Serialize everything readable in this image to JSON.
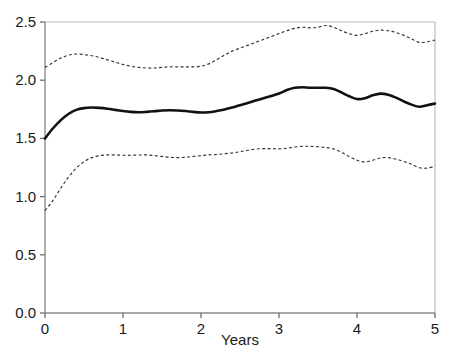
{
  "chart_data": {
    "type": "line",
    "title": "",
    "subtitle": "",
    "xlabel": "Years",
    "ylabel": "",
    "xlim": [
      0,
      5
    ],
    "ylim": [
      0,
      2.5
    ],
    "x_ticks": [
      "0",
      "1",
      "2",
      "3",
      "4",
      "5"
    ],
    "x_tick_values": [
      0,
      1,
      2,
      3,
      4,
      5
    ],
    "y_ticks": [
      "0.0",
      "0.5",
      "1.0",
      "1.5",
      "2.0",
      "2.5"
    ],
    "y_tick_values": [
      0.0,
      0.5,
      1.0,
      1.5,
      2.0,
      2.5
    ],
    "grid": false,
    "legend_position": "none",
    "x": [
      0.0,
      0.1,
      0.2,
      0.3,
      0.4,
      0.5,
      0.6,
      0.7,
      0.8,
      0.9,
      1.0,
      1.1,
      1.2,
      1.3,
      1.4,
      1.5,
      1.6,
      1.7,
      1.8,
      1.9,
      2.0,
      2.1,
      2.2,
      2.3,
      2.4,
      2.5,
      2.6,
      2.7,
      2.8,
      2.9,
      3.0,
      3.1,
      3.2,
      3.3,
      3.4,
      3.5,
      3.6,
      3.7,
      3.8,
      3.9,
      4.0,
      4.1,
      4.2,
      4.3,
      4.4,
      4.5,
      4.6,
      4.7,
      4.8,
      4.9,
      5.0
    ],
    "series": [
      {
        "name": "upper confidence limit",
        "style": "dashed",
        "color": "#333333",
        "values": [
          2.11,
          2.15,
          2.19,
          2.215,
          2.225,
          2.22,
          2.21,
          2.195,
          2.175,
          2.155,
          2.135,
          2.12,
          2.11,
          2.105,
          2.105,
          2.11,
          2.115,
          2.115,
          2.115,
          2.115,
          2.12,
          2.14,
          2.175,
          2.215,
          2.25,
          2.275,
          2.3,
          2.325,
          2.35,
          2.375,
          2.4,
          2.425,
          2.445,
          2.455,
          2.45,
          2.455,
          2.47,
          2.455,
          2.425,
          2.4,
          2.385,
          2.4,
          2.42,
          2.43,
          2.425,
          2.41,
          2.385,
          2.355,
          2.325,
          2.33,
          2.345
        ]
      },
      {
        "name": "mean estimate",
        "style": "solid",
        "color": "#111111",
        "values": [
          1.5,
          1.585,
          1.655,
          1.71,
          1.745,
          1.76,
          1.765,
          1.762,
          1.755,
          1.745,
          1.735,
          1.728,
          1.725,
          1.728,
          1.733,
          1.74,
          1.742,
          1.74,
          1.735,
          1.728,
          1.722,
          1.725,
          1.735,
          1.748,
          1.765,
          1.785,
          1.805,
          1.825,
          1.845,
          1.865,
          1.885,
          1.915,
          1.935,
          1.94,
          1.935,
          1.935,
          1.935,
          1.925,
          1.895,
          1.862,
          1.838,
          1.845,
          1.87,
          1.885,
          1.875,
          1.85,
          1.818,
          1.79,
          1.772,
          1.785,
          1.8
        ]
      },
      {
        "name": "lower confidence limit",
        "style": "dashed",
        "color": "#333333",
        "values": [
          0.88,
          0.965,
          1.07,
          1.165,
          1.245,
          1.3,
          1.335,
          1.352,
          1.358,
          1.358,
          1.355,
          1.355,
          1.357,
          1.358,
          1.352,
          1.345,
          1.338,
          1.335,
          1.338,
          1.345,
          1.352,
          1.358,
          1.362,
          1.368,
          1.375,
          1.385,
          1.398,
          1.408,
          1.412,
          1.412,
          1.41,
          1.415,
          1.425,
          1.432,
          1.432,
          1.428,
          1.422,
          1.41,
          1.382,
          1.345,
          1.312,
          1.298,
          1.312,
          1.332,
          1.335,
          1.322,
          1.302,
          1.278,
          1.248,
          1.245,
          1.262
        ]
      }
    ]
  },
  "axis": {
    "x_title": "Years"
  }
}
